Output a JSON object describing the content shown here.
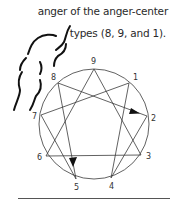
{
  "caption": {
    "line1": "anger of the anger-center",
    "line2": "types (8, 9, and 1)."
  },
  "enneagram": {
    "center": [
      94,
      124
    ],
    "radius": 55,
    "points": [
      {
        "label": "9",
        "x": 94,
        "y": 69
      },
      {
        "label": "1",
        "x": 129,
        "y": 83
      },
      {
        "label": "2",
        "x": 147,
        "y": 116
      },
      {
        "label": "3",
        "x": 141,
        "y": 155
      },
      {
        "label": "4",
        "x": 111,
        "y": 178
      },
      {
        "label": "5",
        "x": 76,
        "y": 179
      },
      {
        "label": "6",
        "x": 46,
        "y": 156
      },
      {
        "label": "7",
        "x": 41,
        "y": 115
      },
      {
        "label": "8",
        "x": 58,
        "y": 83
      }
    ],
    "arrows": [
      {
        "from": "8",
        "to": "2"
      },
      {
        "from": "8",
        "to": "5"
      }
    ],
    "colors": {
      "line": "#3a3a3a",
      "wing": "#111111"
    }
  },
  "labels": {
    "l9": "9",
    "l1": "1",
    "l2": "2",
    "l3": "3",
    "l4": "4",
    "l5": "5",
    "l6": "6",
    "l7": "7",
    "l8": "8"
  }
}
